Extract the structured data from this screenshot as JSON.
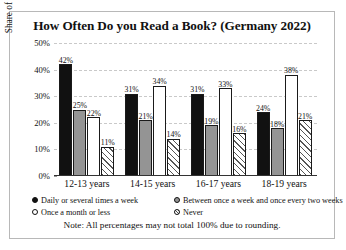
{
  "chart_data": {
    "type": "bar",
    "title": "How Often Do you Read a Book? (Germany 2022)",
    "xlabel": "",
    "ylabel": "Share of respondents",
    "ylim": [
      0,
      50
    ],
    "ytick_labels": [
      "0%",
      "10%",
      "20%",
      "30%",
      "40%",
      "50%"
    ],
    "ytick_values": [
      0,
      10,
      20,
      30,
      40,
      50
    ],
    "grid": true,
    "legend_position": "bottom",
    "categories": [
      "12-13 years",
      "14-15 years",
      "16-17 years",
      "18-19 years"
    ],
    "series": [
      {
        "name": "Daily or several times a week",
        "values": [
          42,
          31,
          31,
          24
        ],
        "labels": [
          "42%",
          "31%",
          "31%",
          "24%"
        ],
        "color": "#111111",
        "pattern": "solid-black"
      },
      {
        "name": "Between once a week and once every two weeks",
        "values": [
          25,
          21,
          19,
          18
        ],
        "labels": [
          "25%",
          "21%",
          "19%",
          "18%"
        ],
        "color": "#949494",
        "pattern": "solid-gray"
      },
      {
        "name": "Once a month or less",
        "values": [
          22,
          34,
          33,
          38
        ],
        "labels": [
          "22%",
          "34%",
          "33%",
          "38%"
        ],
        "color": "#ffffff",
        "pattern": "open-white"
      },
      {
        "name": "Never",
        "values": [
          11,
          14,
          16,
          21
        ],
        "labels": [
          "11%",
          "14%",
          "16%",
          "21%"
        ],
        "color": "#ffffff",
        "pattern": "diagonal-hatch"
      }
    ],
    "note": "Note: All percentages may not total 100% due to rounding."
  }
}
